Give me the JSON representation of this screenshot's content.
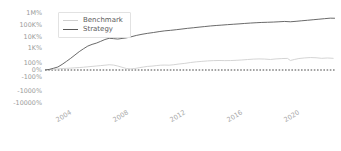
{
  "chart_data": {
    "type": "line",
    "title": "",
    "xlabel": "",
    "ylabel": "",
    "grid": false,
    "legend_position": "upper-left",
    "yscale": "symlog",
    "ytick_labels": [
      "1M%",
      "100K%",
      "10K%",
      "1K%",
      "100%",
      "0%",
      "-100%",
      "-1000%",
      "-10000%"
    ],
    "ytick_values": [
      1000000,
      100000,
      10000,
      1000,
      100,
      0,
      -100,
      -1000,
      -10000
    ],
    "xtick_labels": [
      "2004",
      "2008",
      "2012",
      "2016",
      "2020"
    ],
    "xtick_values": [
      2004,
      2008,
      2012,
      2016,
      2020
    ],
    "xlim": [
      2003.0,
      2023.4
    ],
    "zero_line": {
      "value": 0,
      "style": "dashed",
      "color": "#333333"
    },
    "colors": {
      "benchmark": "#cfcfcf",
      "strategy": "#595959",
      "axis_text": "#9a9a9a",
      "zero_line": "#333333"
    },
    "series": [
      {
        "name": "Benchmark",
        "color": "#cfcfcf",
        "x": [
          2003.0,
          2003.3,
          2003.6,
          2003.9,
          2004.2,
          2004.5,
          2004.8,
          2005.1,
          2005.4,
          2005.7,
          2006.0,
          2006.3,
          2006.6,
          2006.9,
          2007.2,
          2007.5,
          2007.8,
          2008.1,
          2008.4,
          2008.7,
          2009.0,
          2009.3,
          2009.6,
          2009.9,
          2010.2,
          2010.5,
          2010.8,
          2011.1,
          2011.4,
          2011.7,
          2012.0,
          2012.4,
          2012.8,
          2013.2,
          2013.6,
          2014.0,
          2014.4,
          2014.8,
          2015.2,
          2015.6,
          2016.0,
          2016.4,
          2016.8,
          2017.2,
          2017.6,
          2018.0,
          2018.4,
          2018.8,
          2019.2,
          2019.6,
          2020.0,
          2020.2,
          2020.5,
          2020.8,
          2021.2,
          2021.6,
          2022.0,
          2022.4,
          2022.8,
          2023.2
        ],
        "y": [
          0,
          6,
          14,
          22,
          30,
          33,
          38,
          44,
          49,
          56,
          64,
          72,
          80,
          88,
          96,
          104,
          99,
          80,
          55,
          30,
          22,
          30,
          46,
          60,
          72,
          78,
          88,
          96,
          99,
          96,
          104,
          118,
          130,
          150,
          168,
          182,
          196,
          205,
          210,
          206,
          208,
          216,
          228,
          246,
          262,
          272,
          266,
          248,
          272,
          288,
          296,
          210,
          250,
          290,
          320,
          340,
          330,
          300,
          318,
          300
        ]
      },
      {
        "name": "Strategy",
        "color": "#595959",
        "x": [
          2003.0,
          2003.3,
          2003.6,
          2003.9,
          2004.2,
          2004.5,
          2004.8,
          2005.1,
          2005.4,
          2005.7,
          2006.0,
          2006.3,
          2006.6,
          2006.9,
          2007.2,
          2007.5,
          2007.8,
          2008.1,
          2008.4,
          2008.7,
          2009.0,
          2009.4,
          2009.8,
          2010.2,
          2010.6,
          2011.0,
          2011.4,
          2011.8,
          2012.2,
          2012.6,
          2013.0,
          2013.4,
          2013.8,
          2014.2,
          2014.6,
          2015.0,
          2015.4,
          2015.8,
          2016.2,
          2016.6,
          2017.0,
          2017.4,
          2017.8,
          2018.2,
          2018.6,
          2019.0,
          2019.4,
          2019.8,
          2020.2,
          2020.6,
          2021.0,
          2021.4,
          2021.8,
          2022.2,
          2022.6,
          2023.0,
          2023.3
        ],
        "y": [
          0,
          12,
          35,
          60,
          110,
          180,
          300,
          520,
          900,
          1600,
          2800,
          4000,
          5200,
          7500,
          11000,
          14000,
          13000,
          12000,
          13500,
          15000,
          18000,
          24000,
          30000,
          36000,
          42000,
          50000,
          58000,
          64000,
          72000,
          82000,
          94000,
          105000,
          118000,
          132000,
          148000,
          162000,
          175000,
          190000,
          205000,
          220000,
          240000,
          258000,
          275000,
          290000,
          300000,
          312000,
          330000,
          352000,
          330000,
          360000,
          400000,
          440000,
          490000,
          540000,
          600000,
          660000,
          650000
        ]
      }
    ]
  },
  "legend": {
    "entries": [
      {
        "label": "Benchmark",
        "color": "#cfcfcf"
      },
      {
        "label": "Strategy",
        "color": "#595959"
      }
    ]
  }
}
